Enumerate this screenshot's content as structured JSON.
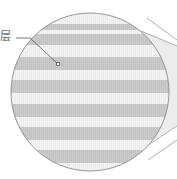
{
  "diagram": {
    "type": "magnified-cross-section",
    "label": {
      "text": "层",
      "meaning": "layer"
    },
    "circle": {
      "cx": 90,
      "cy": 92,
      "r": 79,
      "outline_color": "#8a8a8a",
      "background_color": "#f2f2f2"
    },
    "stripes": {
      "color": "#c9c9c9",
      "bands": [
        {
          "y": 24,
          "h": 6
        },
        {
          "y": 34,
          "h": 11
        },
        {
          "y": 57,
          "h": 13
        },
        {
          "y": 80,
          "h": 13
        },
        {
          "y": 104,
          "h": 13
        },
        {
          "y": 127,
          "h": 13
        },
        {
          "y": 150,
          "h": 13
        }
      ]
    },
    "leader": {
      "color": "#555555",
      "points": [
        [
          16,
          38
        ],
        [
          30,
          38
        ],
        [
          58,
          64
        ]
      ],
      "marker": {
        "x": 58,
        "y": 64,
        "size": 3
      }
    },
    "funnel": {
      "fill": "#ececec",
      "line_color": "#9a9a9a"
    }
  }
}
